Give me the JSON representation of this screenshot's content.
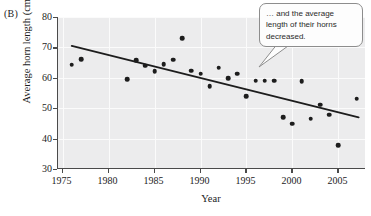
{
  "panel": {
    "label": "(B)"
  },
  "callout": {
    "text": "… and the average length of their horns decreased."
  },
  "axis": {
    "x_label": "Year",
    "y_label": "Average horn length (cm)",
    "x_ticks": [
      "1975",
      "1980",
      "1985",
      "1990",
      "1995",
      "2000",
      "2005"
    ],
    "y_ticks": [
      "80",
      "70",
      "60",
      "50",
      "40",
      "30"
    ]
  },
  "chart_data": {
    "type": "scatter",
    "title": "",
    "xlabel": "Year",
    "ylabel": "Average horn length (cm)",
    "xlim": [
      1974.5,
      2008
    ],
    "ylim": [
      30,
      80
    ],
    "xticks": [
      1975,
      1980,
      1985,
      1990,
      1995,
      2000,
      2005
    ],
    "yticks": [
      30,
      40,
      50,
      60,
      70,
      80
    ],
    "grid": true,
    "legend": "none",
    "marker_color": "#1d1d1d",
    "trendline": {
      "type": "linear",
      "color": "#1d1d1d",
      "x_start": 1976.0,
      "y_start": 70.5,
      "x_end": 2007.2,
      "y_end": 47.0
    },
    "x": [
      1976,
      1977,
      1982,
      1983,
      1984,
      1985,
      1986,
      1987,
      1988,
      1989,
      1990,
      1991,
      1992,
      1993,
      1994,
      1995,
      1996,
      1997,
      1998,
      1999,
      2000,
      2001,
      2002,
      2003,
      2004,
      2005,
      2007
    ],
    "y": [
      64.3,
      66.2,
      59.6,
      65.7,
      64.0,
      62.2,
      64.4,
      66.0,
      73.0,
      62.4,
      61.4,
      57.2,
      63.3,
      59.8,
      61.3,
      54.0,
      59.0,
      59.0,
      59.1,
      47.1,
      44.9,
      58.9,
      46.5,
      51.2,
      47.8,
      37.8,
      53.1
    ],
    "annotations": [
      {
        "text": "… and the average length of their horns decreased.",
        "kind": "callout"
      }
    ],
    "panel_label": "(B)"
  }
}
